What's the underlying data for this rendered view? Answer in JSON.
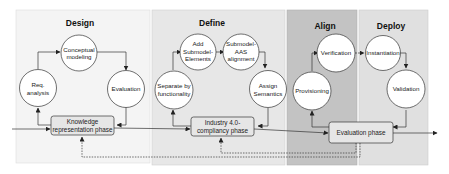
{
  "diagram": {
    "colors": {
      "design_bg": "#f4f4f4",
      "define_bg": "#e7e7e7",
      "align_bg": "#c3c3c3",
      "deploy_bg": "#e0e0e0",
      "phase_box_bg": "#e6e6e6",
      "stroke": "#333333"
    },
    "panels": [
      {
        "title": "Design",
        "nodes": [
          {
            "lines": [
              "Conceptual",
              "modeling"
            ]
          },
          {
            "lines": [
              "Req.",
              "analysis"
            ]
          },
          {
            "lines": [
              "Evaluation"
            ]
          }
        ],
        "phase": {
          "lines": [
            "Knowledge",
            "representation phase"
          ]
        }
      },
      {
        "title": "Define",
        "nodes": [
          {
            "lines": [
              "Add",
              "Submodel-",
              "Elements"
            ]
          },
          {
            "lines": [
              "Submodel-",
              "AAS",
              "alignment"
            ]
          },
          {
            "lines": [
              "Separate by",
              "functionality"
            ]
          },
          {
            "lines": [
              "Assign",
              "Semantics"
            ]
          }
        ],
        "phase": {
          "lines": [
            "Industry 4.0-",
            "compliancy phase"
          ]
        }
      },
      {
        "title": "Align",
        "nodes": [
          {
            "lines": [
              "Verification"
            ]
          },
          {
            "lines": [
              "Provisioning"
            ]
          }
        ]
      },
      {
        "title": "Deploy",
        "nodes": [
          {
            "lines": [
              "Instantiation"
            ]
          },
          {
            "lines": [
              "Validation"
            ]
          }
        ],
        "phase": {
          "lines": [
            "Evaluation phase"
          ]
        }
      }
    ]
  }
}
